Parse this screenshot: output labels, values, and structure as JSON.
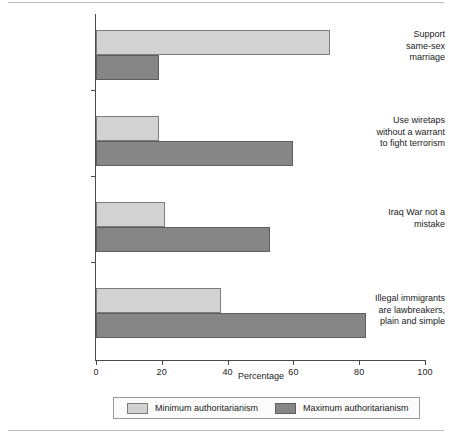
{
  "chart_data": {
    "type": "bar",
    "orientation": "horizontal",
    "title": "",
    "subtitle": "",
    "xlabel": "Percentage",
    "ylabel": "",
    "xlim": [
      0,
      100
    ],
    "xticks": [
      0,
      20,
      40,
      60,
      80,
      100
    ],
    "xticklabels": [
      "0",
      "20",
      "40",
      "60",
      "80",
      "100"
    ],
    "grid": false,
    "legend_position": "bottom",
    "categories": [
      "Support same-sex marriage",
      "Use wiretaps without a warrant to fight terrorism",
      "Iraq War not a mistake",
      "Illegal immigrants are lawbreakers, plain and simple"
    ],
    "category_label_lines": [
      [
        "Support",
        "same-sex",
        "marriage"
      ],
      [
        "Use wiretaps",
        "without a warrant",
        "to fight terrorism"
      ],
      [
        "Iraq War not a",
        "mistake"
      ],
      [
        "Illegal immigrants",
        "are lawbreakers,",
        "plain and simple"
      ]
    ],
    "series": [
      {
        "name": "Minimum authoritarianism",
        "color": "#d2d2d2",
        "values": [
          71,
          19,
          21,
          38
        ]
      },
      {
        "name": "Maximum authoritarianism",
        "color": "#868686",
        "values": [
          19,
          60,
          53,
          82
        ]
      }
    ]
  },
  "legend": {
    "entries": [
      {
        "label": "Minimum authoritarianism"
      },
      {
        "label": "Maximum authoritarianism"
      }
    ]
  },
  "axis": {
    "xlabel": "Percentage"
  }
}
